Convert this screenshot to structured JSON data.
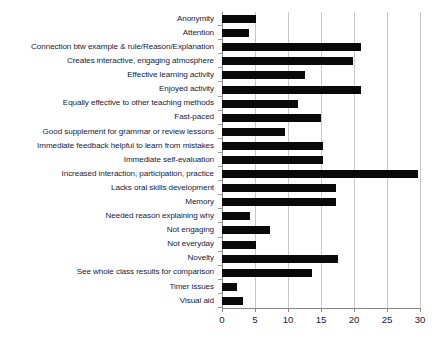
{
  "chart_data": {
    "type": "bar",
    "orientation": "horizontal",
    "title": "",
    "subtitle": "",
    "xlabel": "",
    "ylabel": "",
    "xlim": [
      0,
      30
    ],
    "xticks": [
      0,
      5,
      10,
      15,
      20,
      25,
      30
    ],
    "xtick_labels": [
      "0",
      "5",
      "10",
      "15",
      "20",
      "25",
      "30"
    ],
    "grid": true,
    "grid_axis": "x",
    "legend": null,
    "bar_color": "#0a0a0a",
    "grid_color": "#c8c8c8",
    "axis_color": "#8a8a8a",
    "text_color": "#16213a",
    "categories": [
      "Anonymity",
      "Attention",
      "Connection btw example & rule/Reason/Explanation",
      "Creates interactive, engaging atmosphere",
      "Effective learning activity",
      "Enjoyed activity",
      "Equally effective to other teaching  methods",
      "Fast-paced",
      "Good supplement for grammar or review lessons",
      "Immediate feedback helpful to learn from mistakes",
      "Immediate self-evaluation",
      "Increased interaction, participation, practice",
      "Lacks oral skills development",
      "Memory",
      "Needed reason explaining why",
      "Not engaging",
      "Not everyday",
      "Novelty",
      "See whole class results for comparison",
      "Timer issues",
      "Visual aid"
    ],
    "values": [
      5.2,
      4.1,
      21.0,
      19.8,
      12.5,
      21.0,
      11.5,
      15.0,
      9.5,
      15.3,
      15.3,
      29.7,
      17.3,
      17.3,
      4.3,
      7.3,
      5.2,
      17.5,
      13.6,
      2.2,
      3.2
    ]
  }
}
